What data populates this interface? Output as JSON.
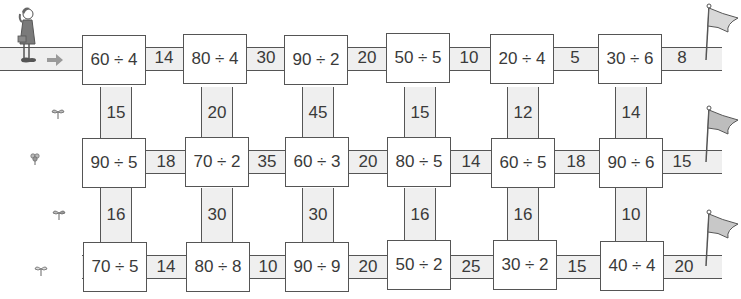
{
  "start_arrow": "arrow-right",
  "rows": [
    {
      "boxes": [
        "60 ÷ 4",
        "80 ÷ 4",
        "90 ÷ 2",
        "50 ÷ 5",
        "20 ÷ 4",
        "30 ÷ 6"
      ],
      "horizontal_answers": [
        "14",
        "30",
        "20",
        "10",
        "5",
        "8"
      ]
    },
    {
      "boxes": [
        "90 ÷ 5",
        "70 ÷ 2",
        "60 ÷ 3",
        "80 ÷ 5",
        "60 ÷ 5",
        "90 ÷ 6"
      ],
      "horizontal_answers": [
        "18",
        "35",
        "20",
        "14",
        "18",
        "15"
      ]
    },
    {
      "boxes": [
        "70 ÷ 5",
        "80 ÷ 8",
        "90 ÷ 9",
        "50 ÷ 2",
        "30 ÷ 2",
        "40 ÷ 4"
      ],
      "horizontal_answers": [
        "14",
        "10",
        "20",
        "25",
        "15",
        "20"
      ]
    }
  ],
  "vertical_answers": [
    [
      "15",
      "20",
      "45",
      "15",
      "12",
      "14"
    ],
    [
      "16",
      "30",
      "30",
      "16",
      "16",
      "10"
    ]
  ],
  "icons": {
    "girl": "girl-icon",
    "flags": [
      "flag-icon",
      "flag-icon",
      "flag-icon"
    ],
    "sprouts": [
      "sprout-icon",
      "flower-icon",
      "sprout-icon",
      "sprout-icon"
    ]
  },
  "colors": {
    "road": "#efefef",
    "stroke": "#555555",
    "text": "#3a3a3a",
    "arrow": "#9a9a9a",
    "flag": "#d8d8d8"
  }
}
